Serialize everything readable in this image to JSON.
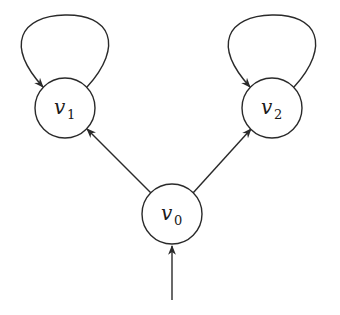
{
  "diagram": {
    "type": "state-graph",
    "colors": {
      "stroke": "#2a2a2a",
      "background": "#ffffff"
    },
    "nodes": [
      {
        "id": "v0",
        "label": "v",
        "subscript": "0",
        "cx": 172,
        "cy": 214,
        "r": 30
      },
      {
        "id": "v1",
        "label": "v",
        "subscript": "1",
        "cx": 65,
        "cy": 108,
        "r": 30
      },
      {
        "id": "v2",
        "label": "v",
        "subscript": "2",
        "cx": 272,
        "cy": 108,
        "r": 30
      }
    ],
    "edges": [
      {
        "from": "start",
        "to": "v0",
        "kind": "initial"
      },
      {
        "from": "v0",
        "to": "v1",
        "kind": "edge"
      },
      {
        "from": "v0",
        "to": "v2",
        "kind": "edge"
      },
      {
        "from": "v1",
        "to": "v1",
        "kind": "self-loop"
      },
      {
        "from": "v2",
        "to": "v2",
        "kind": "self-loop"
      }
    ]
  }
}
